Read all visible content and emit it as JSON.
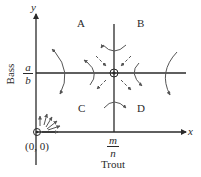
{
  "diagram": {
    "type": "phase-plane",
    "axes": {
      "x_label": "x",
      "y_label": "y",
      "x_title": "Trout",
      "y_title": "Bass",
      "origin_label": "(0, 0)"
    },
    "equilibrium": {
      "x_numerator": "m",
      "x_denominator": "n",
      "y_numerator": "a",
      "y_denominator": "b"
    },
    "regions": [
      "A",
      "B",
      "C",
      "D"
    ],
    "colors": {
      "ink": "#2a2a2a",
      "background": "#ffffff"
    }
  }
}
